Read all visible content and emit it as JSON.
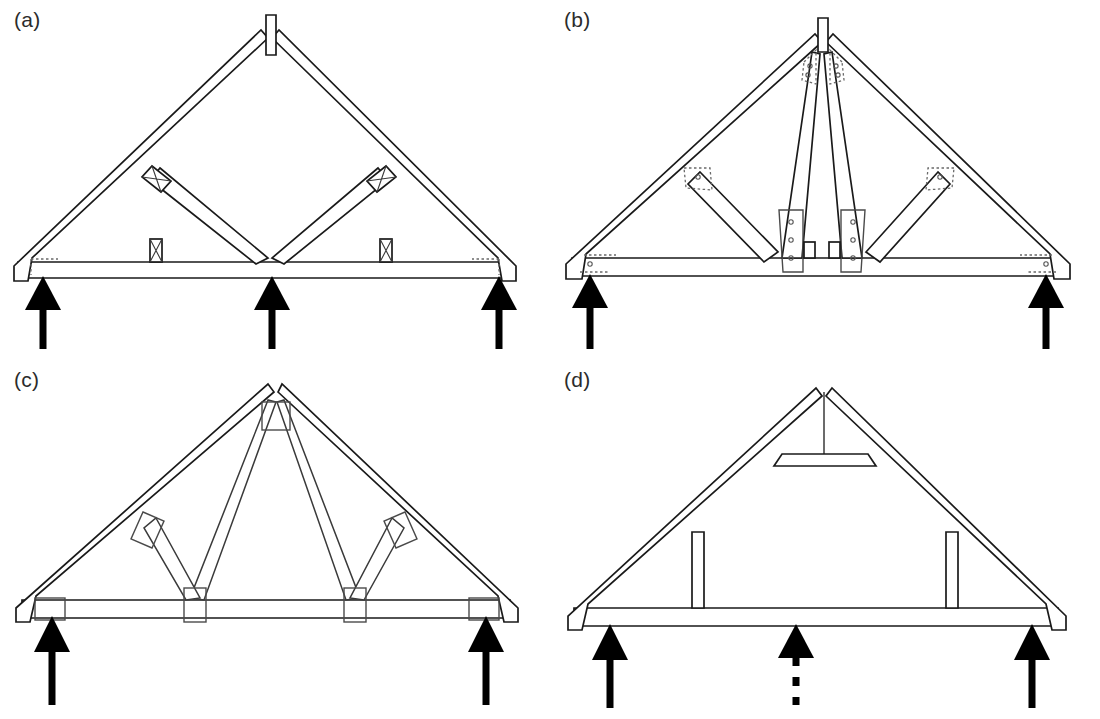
{
  "figure": {
    "type": "technical-line-diagram",
    "background_color": "#ffffff",
    "line_color": "#1a1a1a",
    "arrow_color": "#000000",
    "panel_count": 4,
    "panel_grid": "2 columns x 2 rows"
  },
  "panels": [
    {
      "id": "a",
      "label": "(a)",
      "truss_name": "king-post truss with V-struts",
      "supports": 3,
      "support_positions": [
        "left-heel",
        "mid-span",
        "right-heel"
      ],
      "support_style": [
        "solid",
        "solid",
        "solid"
      ],
      "members": [
        "left rafter (top chord)",
        "right rafter (top chord)",
        "bottom chord / tie beam",
        "apex ridge block",
        "left diagonal strut",
        "right diagonal strut"
      ],
      "connectors": [
        "x-hatched block at left rafter-strut joint",
        "x-hatched block at right rafter-strut joint",
        "x-hatched block on bottom chord left",
        "x-hatched block on bottom chord right",
        "dotted plate at left heel",
        "dotted plate at right heel"
      ]
    },
    {
      "id": "b",
      "label": "(b)",
      "truss_name": "fink truss with nail-plate connectors",
      "supports": 2,
      "support_positions": [
        "left-heel",
        "right-heel"
      ],
      "support_style": [
        "solid",
        "solid"
      ],
      "members": [
        "left rafter (top chord)",
        "right rafter (top chord)",
        "bottom chord / tie beam",
        "apex ridge block",
        "left inner web (apex to bottom chord)",
        "right inner web (apex to bottom chord)",
        "left outer diagonal web",
        "right outer diagonal web"
      ],
      "connectors": [
        "dotted nail plates with nail holes at apex (both sides)",
        "dotted nail plates with nail holes at left and right rafter-web joints",
        "vertical nail plates with nail holes at bottom chord web joints",
        "dotted nail plates with nail holes at both heels"
      ]
    },
    {
      "id": "c",
      "label": "(c)",
      "truss_name": "fink truss, thin members with rectangular gang-nail plates",
      "supports": 2,
      "support_positions": [
        "left-heel",
        "right-heel"
      ],
      "support_style": [
        "solid",
        "solid"
      ],
      "members": [
        "left rafter (top chord)",
        "right rafter (top chord)",
        "bottom chord / tie beam",
        "left inner web (apex to bottom chord)",
        "right inner web (apex to bottom chord)",
        "left outer diagonal web",
        "right outer diagonal web"
      ],
      "connectors": [
        "square plate at apex",
        "rectangular plates at left and right rafter-web joints",
        "rectangular plates at both bottom chord web joints",
        "rectangular plates at both heels"
      ]
    },
    {
      "id": "d",
      "label": "(d)",
      "truss_name": "attic / room-in-roof truss with collar tie",
      "supports": 3,
      "support_positions": [
        "left-heel",
        "mid-span",
        "right-heel"
      ],
      "support_style": [
        "solid",
        "dashed",
        "solid"
      ],
      "members": [
        "left rafter (top chord)",
        "right rafter (top chord)",
        "bottom chord / ceiling tie",
        "collar tie near apex",
        "apex king-post stub",
        "left vertical post",
        "right vertical post"
      ],
      "connectors": []
    }
  ],
  "legend_notes": {
    "solid_arrow_meaning": "support reaction / bearing point",
    "dashed_arrow_meaning": "optional or intermediate support"
  }
}
